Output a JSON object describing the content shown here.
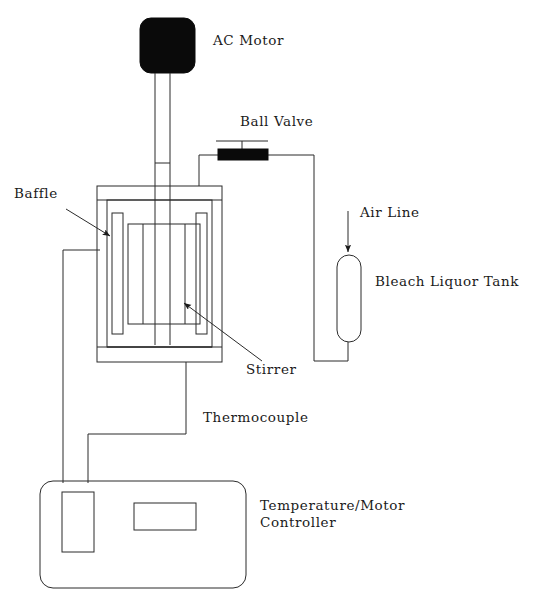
{
  "figure": {
    "background_color": "#ffffff",
    "line_color": "#2b2b2b",
    "fill_black": "#000000",
    "text_color": "#1a1a1a"
  },
  "labels": {
    "ac_motor": "AC Motor",
    "ball_valve": "Ball Valve",
    "baffle": "Baffle",
    "air_line": "Air Line",
    "bleach_liquor_tank": "Bleach Liquor Tank",
    "stirrer": "Stirrer",
    "thermocouple": "Thermocouple",
    "temperature_motor_controller_line1": "Temperature/Motor",
    "temperature_motor_controller_line2": "Controller"
  },
  "components": [
    {
      "id": "ac-motor",
      "label": "AC Motor",
      "shape": "rounded-rect-filled"
    },
    {
      "id": "stirrer-shaft",
      "label": "Stirrer",
      "shape": "vertical-shaft"
    },
    {
      "id": "ball-valve",
      "label": "Ball Valve",
      "shape": "filled-bar-with-handle"
    },
    {
      "id": "reactor-vessel",
      "label": "Reactor",
      "shape": "jacketed-vessel"
    },
    {
      "id": "baffle",
      "label": "Baffle",
      "shape": "vertical-plate"
    },
    {
      "id": "bleach-liquor-tank",
      "label": "Bleach Liquor Tank",
      "shape": "capsule"
    },
    {
      "id": "air-line",
      "label": "Air Line",
      "shape": "arrow-down"
    },
    {
      "id": "thermocouple",
      "label": "Thermocouple",
      "shape": "wire"
    },
    {
      "id": "controller",
      "label": "Temperature/Motor Controller",
      "shape": "rounded-rect"
    }
  ],
  "annotations": [
    {
      "name": "baffle-pointer",
      "label": "Baffle",
      "arrow": "down-right"
    },
    {
      "name": "stirrer-pointer",
      "label": "Stirrer",
      "arrow": "up-left"
    },
    {
      "name": "air-line-pointer",
      "label": "Air Line",
      "arrow": "down"
    }
  ]
}
